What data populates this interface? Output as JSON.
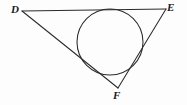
{
  "figure": {
    "background_color": "#fdfdfd",
    "stroke_color": "#2b2b2b",
    "labels": {
      "d": "D",
      "e": "E",
      "f": "F"
    },
    "geometry": {
      "type": "triangle-with-circle",
      "vertices": [
        {
          "name": "D",
          "x": 22,
          "y": 11
        },
        {
          "name": "E",
          "x": 166,
          "y": 9
        },
        {
          "name": "F",
          "x": 118,
          "y": 88
        }
      ],
      "edges": [
        {
          "name": "DE",
          "from": "D",
          "to": "E"
        },
        {
          "name": "DF",
          "from": "D",
          "to": "F"
        },
        {
          "name": "EF",
          "from": "E",
          "to": "F"
        }
      ],
      "circle": {
        "center_x": 110,
        "center_y": 42,
        "radius": 33,
        "tangent_to": [
          "DE",
          "DF"
        ]
      }
    }
  }
}
